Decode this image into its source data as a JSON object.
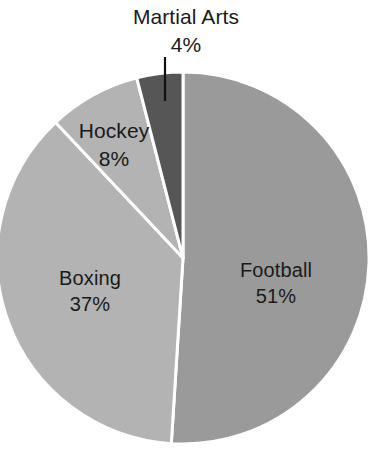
{
  "chart_data": {
    "type": "pie",
    "title": "",
    "subtitle": "",
    "xlabel": "",
    "ylabel": "",
    "legend_position": "none",
    "grid": false,
    "units": "percent",
    "categories": [
      "Football",
      "Boxing",
      "Hockey",
      "Martial Arts"
    ],
    "values": [
      51,
      37,
      8,
      4
    ],
    "slices": [
      {
        "label": "Football",
        "value": 51,
        "value_text": "51%",
        "color": "#9a9a9a",
        "start_angle_deg": 0,
        "end_angle_deg": 183.6,
        "label_placement": "inside",
        "has_leader_line": false
      },
      {
        "label": "Boxing",
        "value": 37,
        "value_text": "37%",
        "color": "#b3b3b3",
        "start_angle_deg": 183.6,
        "end_angle_deg": 316.8,
        "label_placement": "inside",
        "has_leader_line": false
      },
      {
        "label": "Hockey",
        "value": 8,
        "value_text": "8%",
        "color": "#b3b3b3",
        "start_angle_deg": 316.8,
        "end_angle_deg": 345.6,
        "label_placement": "inside",
        "has_leader_line": false
      },
      {
        "label": "Martial Arts",
        "value": 4,
        "value_text": "4%",
        "color": "#565656",
        "start_angle_deg": 345.6,
        "end_angle_deg": 360,
        "label_placement": "outside",
        "has_leader_line": true
      }
    ],
    "style": {
      "background_color": "#ffffff",
      "divider_color": "#ffffff",
      "divider_width_px": 3,
      "label_color": "#1a1a1a",
      "leader_line_color": "#111111",
      "center_x": 183,
      "center_y": 258,
      "radius": 186,
      "start_angle_deg": 0,
      "direction": "clockwise"
    }
  },
  "labels": {
    "football": {
      "name": "Football",
      "value_text": "51%"
    },
    "boxing": {
      "name": "Boxing",
      "value_text": "37%"
    },
    "hockey": {
      "name": "Hockey",
      "value_text": "8%"
    },
    "martial_arts": {
      "name": "Martial Arts",
      "value_text": "4%"
    }
  }
}
